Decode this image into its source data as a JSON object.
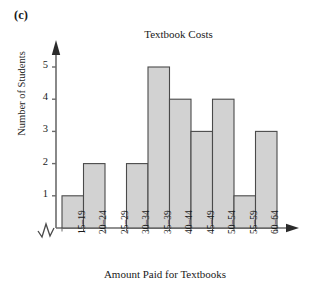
{
  "figure": {
    "panel_label": "(c)",
    "ylabel": "Number of Students",
    "xlabel": "Amount Paid for Textbooks",
    "axis_break_symbol": "zigzag"
  },
  "chart_data": {
    "type": "bar",
    "title": "Textbook Costs",
    "xlabel": "Amount Paid for Textbooks",
    "ylabel": "Number of Students",
    "categories": [
      "15–19",
      "20–24",
      "25–29",
      "30–34",
      "35–39",
      "40–44",
      "45–49",
      "50–54",
      "55–59",
      "60–64"
    ],
    "values": [
      1,
      2,
      0,
      2,
      5,
      4,
      3,
      4,
      1,
      3
    ],
    "ylim": [
      0,
      5
    ],
    "yticks": [
      "1",
      "2",
      "3",
      "4",
      "5"
    ],
    "ytick_values": [
      1,
      2,
      3,
      4,
      5
    ],
    "grid": false,
    "legend": false,
    "bar_fill": "#d2d2d2",
    "bar_stroke": "#4a4a4a",
    "axis_color": "#6b6b6b"
  }
}
